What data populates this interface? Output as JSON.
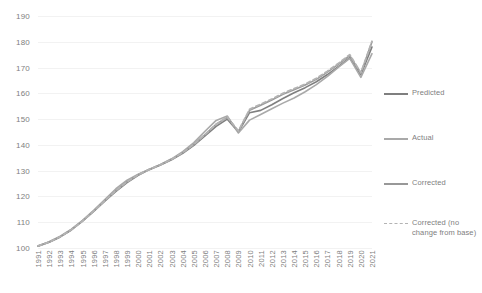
{
  "chart_data": {
    "type": "line",
    "title": "",
    "xlabel": "",
    "ylabel": "",
    "ylim": [
      100,
      190
    ],
    "ytick_step": 10,
    "yticks": [
      190,
      180,
      170,
      160,
      150,
      140,
      130,
      120,
      110,
      100
    ],
    "grid": true,
    "legend_position": "right",
    "categories": [
      "1991",
      "1992",
      "1993",
      "1994",
      "1995",
      "1996",
      "1997",
      "1998",
      "1999",
      "2000",
      "2001",
      "2002",
      "2003",
      "2004",
      "2005",
      "2006",
      "2007",
      "2008",
      "2009",
      "2010",
      "2011",
      "2012",
      "2013",
      "2014",
      "2015",
      "2016",
      "2017",
      "2018",
      "2019",
      "2020",
      "2021"
    ],
    "series": [
      {
        "name": "Predicted",
        "color": "#7f7f7f",
        "style": "solid",
        "width": 1.6,
        "values": [
          100.7,
          102.2,
          104.3,
          107.0,
          110.4,
          114.2,
          118.2,
          122.0,
          125.4,
          128.2,
          130.4,
          132.2,
          134.2,
          136.7,
          139.8,
          143.5,
          147.2,
          150.0,
          145.0,
          152.5,
          153.4,
          155.6,
          158.0,
          160.2,
          162.2,
          164.5,
          167.3,
          170.5,
          173.8,
          167.2,
          178.0
        ]
      },
      {
        "name": "Actual",
        "color": "#a9a9a9",
        "style": "solid",
        "width": 1.6,
        "values": [
          100.8,
          102.4,
          104.6,
          107.3,
          110.7,
          114.6,
          118.8,
          123.0,
          126.3,
          128.6,
          130.6,
          132.4,
          134.6,
          137.4,
          140.9,
          145.3,
          149.5,
          151.2,
          144.6,
          149.6,
          151.8,
          154.0,
          156.2,
          158.2,
          160.6,
          163.4,
          166.6,
          170.2,
          173.6,
          166.2,
          175.4
        ]
      },
      {
        "name": "Corrected",
        "color": "#989898",
        "style": "solid",
        "width": 1.6,
        "values": [
          100.8,
          102.3,
          104.4,
          107.1,
          110.5,
          114.3,
          118.4,
          122.3,
          125.7,
          128.4,
          130.5,
          132.3,
          134.4,
          137.0,
          140.2,
          144.0,
          148.0,
          150.6,
          145.2,
          153.4,
          155.4,
          157.4,
          159.6,
          161.4,
          163.2,
          165.4,
          168.2,
          171.3,
          174.6,
          167.8,
          180.0
        ]
      },
      {
        "name": "Corrected (no change from base)",
        "color": "#b3b3b3",
        "style": "dashed",
        "width": 1.8,
        "values": [
          100.8,
          102.3,
          104.4,
          107.1,
          110.5,
          114.3,
          118.4,
          122.3,
          125.7,
          128.4,
          130.5,
          132.3,
          134.4,
          137.0,
          140.2,
          144.0,
          148.0,
          150.8,
          145.4,
          153.8,
          155.8,
          157.8,
          160.0,
          161.8,
          163.6,
          165.8,
          168.6,
          171.7,
          175.0,
          168.0,
          180.2
        ]
      }
    ]
  },
  "legend": {
    "entries": [
      {
        "label": "Predicted",
        "color": "#7f7f7f",
        "style": "solid"
      },
      {
        "label": "Actual",
        "color": "#a9a9a9",
        "style": "solid"
      },
      {
        "label": "Corrected",
        "color": "#989898",
        "style": "solid"
      },
      {
        "label": "Corrected (no change from base)",
        "color": "#b3b3b3",
        "style": "dashed"
      }
    ]
  }
}
